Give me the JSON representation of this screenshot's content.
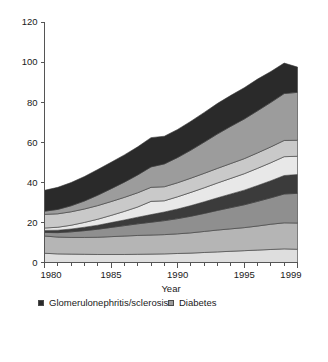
{
  "chart_data": {
    "type": "area",
    "stacked": true,
    "title": "",
    "xlabel": "Year",
    "ylabel": "",
    "xlim": [
      1980,
      1999
    ],
    "ylim": [
      0,
      120
    ],
    "ytick_labels": [
      "0",
      "20",
      "40",
      "60",
      "80",
      "100",
      "120"
    ],
    "yticks": [
      0,
      20,
      40,
      60,
      80,
      100,
      120
    ],
    "xtick_labels": [
      "1980",
      "1985",
      "1990",
      "1995",
      "1999"
    ],
    "xticks": [
      1980,
      1985,
      1990,
      1995,
      1999
    ],
    "x_minor_tick_step": 1,
    "grid": false,
    "legend_position": "below-plot-two-columns",
    "x": [
      1980,
      1981,
      1982,
      1983,
      1984,
      1985,
      1986,
      1987,
      1988,
      1989,
      1990,
      1991,
      1992,
      1993,
      1994,
      1995,
      1996,
      1997,
      1998,
      1999
    ],
    "stack_order_bottom_to_top": [
      "Polycystic kidneys adult type",
      "Unknown",
      "Miscellaneous",
      "Renal vascular disease",
      "Hypertension",
      "Pyelonephritis",
      "Diabetes",
      "Glomerulonephritis/sclerosis"
    ],
    "series": [
      {
        "name": "Polycystic kidneys adult type",
        "color": "#dedede",
        "values": [
          4.6,
          4.3,
          4.2,
          4.1,
          4.0,
          4.0,
          4.0,
          4.1,
          4.2,
          4.3,
          4.5,
          4.7,
          5.0,
          5.3,
          5.6,
          5.9,
          6.2,
          6.5,
          6.8,
          6.6
        ]
      },
      {
        "name": "Unknown",
        "color": "#b5b5b5",
        "values": [
          8.6,
          8.4,
          8.3,
          8.4,
          8.6,
          8.9,
          9.2,
          9.4,
          9.5,
          9.6,
          9.8,
          10.1,
          10.5,
          10.9,
          11.2,
          11.5,
          12.0,
          12.6,
          13.0,
          13.1
        ]
      },
      {
        "name": "Miscellaneous",
        "color": "#8f8f8f",
        "values": [
          1.8,
          2.2,
          2.8,
          3.4,
          4.0,
          4.6,
          5.2,
          5.8,
          6.4,
          7.0,
          7.6,
          8.3,
          9.0,
          9.8,
          10.6,
          11.4,
          12.3,
          13.2,
          14.4,
          14.8
        ]
      },
      {
        "name": "Renal vascular disease",
        "color": "#3b3b3b",
        "values": [
          1.0,
          1.2,
          1.4,
          1.7,
          2.0,
          2.4,
          2.8,
          3.3,
          3.8,
          4.3,
          4.8,
          5.3,
          5.8,
          6.3,
          6.8,
          7.3,
          7.9,
          8.5,
          9.2,
          9.4
        ]
      },
      {
        "name": "Hypertension",
        "color": "#e8e8e8",
        "values": [
          1.2,
          1.5,
          1.9,
          2.4,
          3.0,
          3.6,
          4.3,
          5.1,
          6.6,
          5.6,
          6.1,
          6.6,
          7.0,
          7.4,
          7.8,
          8.2,
          8.6,
          9.0,
          9.4,
          9.1
        ]
      },
      {
        "name": "Pyelonephritis",
        "color": "#c9c9c9",
        "values": [
          6.8,
          6.7,
          6.7,
          6.7,
          6.8,
          6.9,
          7.0,
          7.1,
          7.0,
          7.0,
          7.0,
          7.1,
          7.2,
          7.3,
          7.4,
          7.5,
          7.7,
          7.9,
          8.1,
          8.0
        ]
      },
      {
        "name": "Diabetes",
        "color": "#9c9c9c",
        "values": [
          1.6,
          2.2,
          3.0,
          4.0,
          5.2,
          6.4,
          7.6,
          8.9,
          10.2,
          11.4,
          12.6,
          14.0,
          15.6,
          17.2,
          18.6,
          19.8,
          21.0,
          22.2,
          23.4,
          23.9
        ]
      },
      {
        "name": "Glomerulonephritis/sclerosis",
        "color": "#2a2a2a",
        "values": [
          10.4,
          11.0,
          11.6,
          12.2,
          12.8,
          13.2,
          13.6,
          14.0,
          14.6,
          13.8,
          14.0,
          14.4,
          14.8,
          15.2,
          15.4,
          15.6,
          15.8,
          15.4,
          15.2,
          12.6
        ]
      }
    ],
    "totals": [
      36.0,
      37.5,
      39.9,
      42.9,
      46.4,
      50.0,
      53.7,
      57.7,
      62.3,
      63.0,
      66.4,
      70.5,
      74.9,
      79.4,
      83.4,
      87.2,
      91.5,
      95.3,
      99.5,
      97.5
    ],
    "legend_columns": [
      {
        "items": [
          {
            "label": "Glomerulonephritis/sclerosis",
            "color": "#2a2a2a"
          },
          {
            "label": "Diabetes",
            "color": "#9c9c9c"
          },
          {
            "label": "Pyelonephritis",
            "color": "#c9c9c9"
          },
          {
            "label": "Hypertension",
            "color": "#e8e8e8"
          }
        ]
      },
      {
        "items": [
          {
            "label": "Renal vascular disease",
            "color": "#3b3b3b"
          },
          {
            "label": "Miscellaneous",
            "color": "#8f8f8f"
          },
          {
            "label": "Unknown",
            "color": "#b5b5b5"
          },
          {
            "label": "Polycystic kidneys adult type",
            "color": "#dedede"
          }
        ]
      }
    ]
  }
}
